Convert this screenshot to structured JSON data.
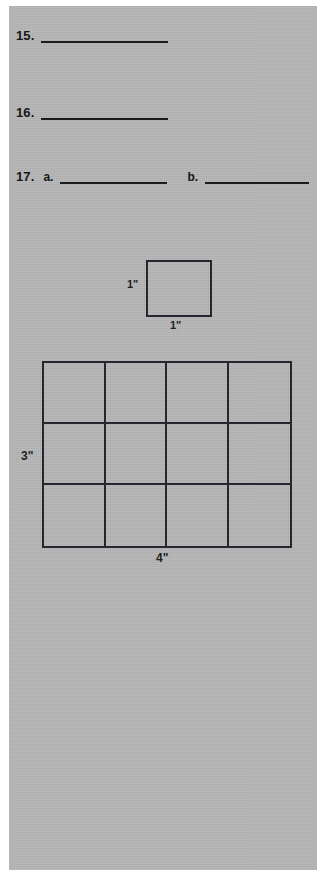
{
  "page": {
    "background_color": "#b6b6b6",
    "margin_color": "#ffffff",
    "ink_color": "#20222a"
  },
  "problems": [
    {
      "number": "15.",
      "parts": [
        {
          "label": "",
          "answer_value": ""
        }
      ]
    },
    {
      "number": "16.",
      "parts": [
        {
          "label": "",
          "answer_value": ""
        }
      ]
    },
    {
      "number": "17.",
      "parts": [
        {
          "label": "a.",
          "answer_value": ""
        },
        {
          "label": "b.",
          "answer_value": ""
        }
      ]
    }
  ],
  "figures": {
    "unit_square": {
      "height_label": "1\"",
      "width_label": "1\"",
      "rows": 1,
      "columns": 1
    },
    "area_grid": {
      "height_label": "3\"",
      "width_label": "4\"",
      "rows": 3,
      "columns": 4
    }
  }
}
